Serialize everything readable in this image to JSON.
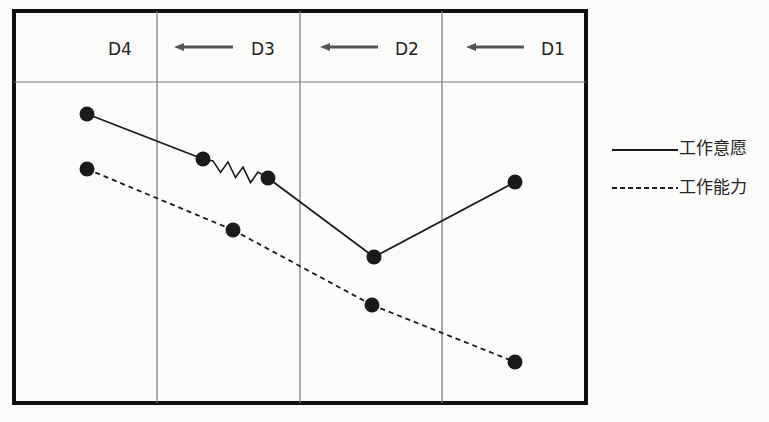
{
  "diagram": {
    "stages": [
      {
        "label": "D4",
        "x": 122,
        "y": 50
      },
      {
        "label": "D3",
        "x": 265,
        "y": 50
      },
      {
        "label": "D2",
        "x": 408,
        "y": 50
      },
      {
        "label": "D1",
        "x": 553,
        "y": 50
      }
    ],
    "arrows": [
      {
        "from_x": 233,
        "to_x": 174,
        "y": 47
      },
      {
        "from_x": 378,
        "to_x": 320,
        "y": 47
      },
      {
        "from_x": 524,
        "to_x": 466,
        "y": 47
      }
    ],
    "frame": {
      "x": 14,
      "y": 11,
      "w": 572,
      "h": 392,
      "header_divider_y": 82,
      "column_dividers_x": [
        157,
        300,
        442
      ]
    },
    "series": [
      {
        "name": "工作意愿",
        "style": "solid",
        "points": [
          [
            87,
            114
          ],
          [
            203,
            159
          ],
          [
            268,
            178
          ],
          [
            374,
            257
          ],
          [
            515,
            182
          ]
        ],
        "zigzag_segment": [
          1,
          2
        ]
      },
      {
        "name": "工作能力",
        "style": "dashed",
        "points": [
          [
            87,
            169
          ],
          [
            233,
            230
          ],
          [
            372,
            305
          ],
          [
            515,
            362
          ]
        ]
      }
    ],
    "legend": [
      {
        "label": "工作意愿",
        "style": "solid",
        "line_x1": 612,
        "line_x2": 678,
        "y": 150
      },
      {
        "label": "工作能力",
        "style": "dashed",
        "line_x1": 612,
        "line_x2": 678,
        "y": 188
      }
    ],
    "colors": {
      "line": "#1a1a1a",
      "grid": "#777777",
      "frame": "#111111",
      "arrow": "#555555",
      "background": "#fbfbfa"
    }
  }
}
